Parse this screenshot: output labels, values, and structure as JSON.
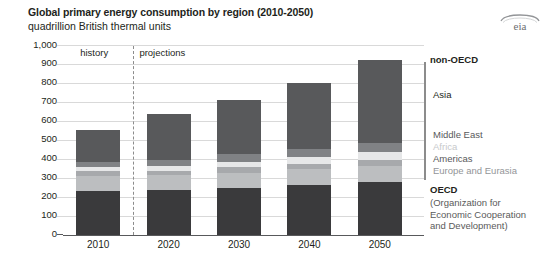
{
  "header": {
    "title": "Global primary energy consumption by region (2010-2050)",
    "subtitle": "quadrillion British thermal units",
    "logo_text": "eia",
    "logo_name": "eia-logo-icon"
  },
  "annotations": {
    "history": "history",
    "projections": "projections"
  },
  "legend": {
    "non_oecd_label": "non-OECD",
    "oecd_label": "OECD",
    "oecd_expansion_line1": "(Organization for",
    "oecd_expansion_line2": "Economic Cooperation",
    "oecd_expansion_line3": "and Development)",
    "entries": [
      {
        "label": "Asia",
        "color": "#58595b"
      },
      {
        "label": "Middle East",
        "color": "#808285"
      },
      {
        "label": "Africa",
        "color": "#e6e7e8"
      },
      {
        "label": "Americas",
        "color": "#a7a9ac"
      },
      {
        "label": "Europe and Eurasia",
        "color": "#bcbec0"
      }
    ]
  },
  "chart_data": {
    "type": "bar",
    "stacked": true,
    "title": "Global primary energy consumption by region (2010-2050)",
    "subtitle": "quadrillion British thermal units",
    "xlabel": "",
    "ylabel": "quadrillion British thermal units",
    "ylim": [
      0,
      1000
    ],
    "ytick_step": 100,
    "yticks": [
      "0",
      "100",
      "200",
      "300",
      "400",
      "500",
      "600",
      "700",
      "800",
      "900",
      "1,000"
    ],
    "grid": true,
    "legend_position": "right",
    "categories": [
      "2010",
      "2020",
      "2030",
      "2040",
      "2050"
    ],
    "series": [
      {
        "name": "OECD",
        "color": "#3a3a3c",
        "values": [
          233,
          237,
          249,
          264,
          277
        ]
      },
      {
        "name": "Europe and Eurasia",
        "color": "#bcbec0",
        "values": [
          80,
          77,
          80,
          82,
          85
        ]
      },
      {
        "name": "Americas",
        "color": "#a7a9ac",
        "values": [
          22,
          24,
          27,
          30,
          33
        ]
      },
      {
        "name": "Africa",
        "color": "#e6e7e8",
        "values": [
          22,
          26,
          30,
          35,
          41
        ]
      },
      {
        "name": "Middle East",
        "color": "#808285",
        "values": [
          26,
          33,
          38,
          44,
          50
        ]
      },
      {
        "name": "Asia",
        "color": "#58595b",
        "values": [
          172,
          238,
          286,
          345,
          434
        ]
      }
    ],
    "totals": [
      555,
      635,
      710,
      800,
      920
    ],
    "history_years": [
      "2010"
    ],
    "projection_years": [
      "2020",
      "2030",
      "2040",
      "2050"
    ],
    "divider_after_category": "2010"
  }
}
